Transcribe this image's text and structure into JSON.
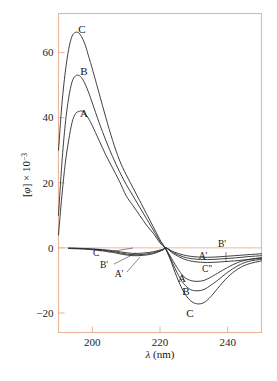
{
  "figure": {
    "name": "cd-spectra-figure",
    "frame_color": "#e8b49a",
    "curve_color": "#2b2b2b",
    "background": "#ffffff"
  },
  "axes": {
    "x": {
      "label_italic": "λ",
      "label_rest": " (nm)",
      "label_full": "λ (nm)",
      "min": 190,
      "max": 250,
      "ticks": [
        200,
        220,
        240
      ],
      "tick_labels": [
        "200",
        "220",
        "240"
      ]
    },
    "y": {
      "label_bracket_open": "[",
      "label_phi": "φ",
      "label_bracket_close": "]",
      "label_times": " × 10",
      "label_exponent": "−3",
      "label_full": "[φ] × 10⁻³",
      "min": -26,
      "max": 72,
      "ticks": [
        60,
        40,
        20,
        0,
        -20
      ],
      "tick_labels": [
        "60",
        "40",
        "20",
        "0",
        "−20"
      ]
    }
  },
  "curve_labels": [
    {
      "id": "peak-C",
      "text": "C",
      "x": 82,
      "y": 33
    },
    {
      "id": "peak-B",
      "text": "B",
      "x": 84,
      "y": 75
    },
    {
      "id": "peak-A",
      "text": "A",
      "x": 84,
      "y": 117
    },
    {
      "id": "trough-A",
      "text": "A",
      "x": 182,
      "y": 282
    },
    {
      "id": "trough-B",
      "text": "B",
      "x": 186,
      "y": 295
    },
    {
      "id": "trough-C",
      "text": "C",
      "x": 190,
      "y": 317
    },
    {
      "id": "prime-left-C",
      "text": "C'",
      "x": 97,
      "y": 256
    },
    {
      "id": "prime-left-B",
      "text": "B'",
      "x": 104,
      "y": 268
    },
    {
      "id": "prime-left-A",
      "text": "A'",
      "x": 119,
      "y": 277
    },
    {
      "id": "prime-right-A",
      "text": "A'",
      "x": 203,
      "y": 259
    },
    {
      "id": "prime-right-B",
      "text": "B'",
      "x": 222,
      "y": 247
    },
    {
      "id": "prime-right-C",
      "text": "C\"",
      "x": 207,
      "y": 272
    }
  ],
  "chart_data": {
    "type": "line",
    "title": "",
    "subtitle": "",
    "xlabel": "λ (nm)",
    "ylabel": "[φ] × 10⁻³",
    "xlim": [
      190,
      250
    ],
    "ylim": [
      -26,
      72
    ],
    "xticks": [
      200,
      220,
      240
    ],
    "yticks": [
      60,
      40,
      20,
      0,
      -20
    ],
    "grid": false,
    "legend": "inline-curve-labels",
    "annotations": [
      "C",
      "B",
      "A",
      "A'",
      "B'",
      "C'",
      "C\""
    ],
    "series": [
      {
        "name": "C",
        "comment": "Largest amplitude positive band, peak ~66 at 196 nm, trough ~-17 at 231 nm",
        "peak_value": 66,
        "peak_x": 196,
        "trough_value": -17,
        "trough_x": 231,
        "zero_crossing": 221.5,
        "x": [
          190,
          191,
          192,
          193,
          194,
          195,
          196,
          197,
          198,
          199,
          200,
          202,
          204,
          206,
          208,
          210,
          212,
          214,
          216,
          218,
          220,
          221.5,
          223,
          225,
          227,
          229,
          231,
          233,
          235,
          237,
          240,
          243,
          246,
          250
        ],
        "y": [
          30,
          44,
          54,
          61,
          65,
          66.2,
          66,
          64.5,
          62,
          58.5,
          55,
          47.5,
          40,
          33,
          27,
          22.5,
          18.5,
          14.5,
          10.5,
          6.5,
          2.5,
          0,
          -3.5,
          -9,
          -13.5,
          -16.2,
          -17.2,
          -16.8,
          -15,
          -12.5,
          -9,
          -6.5,
          -5,
          -4
        ]
      },
      {
        "name": "B",
        "comment": "Middle positive band, peak ~53 at 196.5 nm, trough ~-13 at 231 nm",
        "peak_value": 53,
        "peak_x": 196.5,
        "trough_value": -13,
        "trough_x": 231,
        "zero_crossing": 221.5,
        "x": [
          190,
          191,
          192,
          193,
          194,
          195,
          196,
          197,
          198,
          199,
          200,
          202,
          204,
          206,
          208,
          210,
          212,
          214,
          216,
          218,
          220,
          221.5,
          223,
          225,
          227,
          229,
          231,
          233,
          235,
          237,
          240,
          243,
          246,
          250
        ],
        "y": [
          10,
          26,
          38,
          46,
          51,
          52.8,
          53,
          52,
          50,
          47.5,
          44.5,
          38.5,
          33,
          28,
          23.5,
          19.5,
          16,
          12.5,
          9,
          5.5,
          2,
          0,
          -3,
          -7.5,
          -11,
          -12.8,
          -13.2,
          -12.8,
          -11.5,
          -10,
          -7.5,
          -5.5,
          -4.2,
          -3.5
        ]
      },
      {
        "name": "A",
        "comment": "Smallest positive band, peak ~42 at 197 nm, trough ~-10 at 231 nm",
        "peak_value": 42,
        "peak_x": 197,
        "trough_value": -10,
        "trough_x": 231,
        "zero_crossing": 221.5,
        "x": [
          190,
          191,
          192,
          193,
          194,
          195,
          196,
          197,
          198,
          199,
          200,
          202,
          204,
          206,
          208,
          210,
          212,
          214,
          216,
          218,
          220,
          221.5,
          223,
          225,
          227,
          229,
          231,
          233,
          235,
          237,
          240,
          243,
          246,
          250
        ],
        "y": [
          4,
          16,
          26,
          33,
          38.5,
          41.2,
          41.9,
          42,
          41,
          39.5,
          37.5,
          33,
          28.5,
          24.5,
          20.5,
          16,
          13,
          10,
          7,
          4.5,
          1.5,
          0,
          -2.5,
          -6,
          -8.8,
          -10,
          -10.3,
          -10,
          -9,
          -7.8,
          -6,
          -4.5,
          -3.6,
          -3
        ]
      },
      {
        "name": "C'",
        "comment": "Shallow secondary trace, small negative dip ~-3.5 near 213 nm, shallowest of primed set",
        "x": [
          193,
          198,
          202,
          206,
          209,
          212,
          215,
          218,
          221,
          221.8,
          224,
          227,
          230,
          234,
          238,
          242,
          246,
          250
        ],
        "y": [
          -0.2,
          -0.4,
          -0.8,
          -1.4,
          -2.0,
          -2.4,
          -2.3,
          -1.8,
          -0.6,
          0,
          -1.8,
          -3.4,
          -4.2,
          -4.5,
          -4.3,
          -4.0,
          -3.6,
          -3.2
        ]
      },
      {
        "name": "B'",
        "comment": "Shallow secondary trace, dip ~-3 near 214 nm",
        "x": [
          193,
          198,
          202,
          206,
          209,
          212,
          215,
          218,
          221,
          221.8,
          224,
          227,
          230,
          234,
          238,
          242,
          246,
          250
        ],
        "y": [
          -0.1,
          -0.3,
          -0.6,
          -1.1,
          -1.7,
          -2.1,
          -2.0,
          -1.5,
          -0.5,
          0,
          -1.5,
          -2.8,
          -3.4,
          -3.6,
          -3.4,
          -3.1,
          -2.7,
          -2.4
        ]
      },
      {
        "name": "A'",
        "comment": "Shallow secondary trace, dip ~-2.5 near 214 nm",
        "x": [
          193,
          198,
          202,
          206,
          209,
          212,
          215,
          218,
          221,
          221.8,
          224,
          227,
          230,
          234,
          238,
          242,
          246,
          250
        ],
        "y": [
          -0.05,
          -0.2,
          -0.45,
          -0.85,
          -1.35,
          -1.7,
          -1.6,
          -1.2,
          -0.35,
          0,
          -1.2,
          -2.2,
          -2.7,
          -2.9,
          -2.7,
          -2.4,
          -2.1,
          -1.8
        ]
      }
    ]
  }
}
